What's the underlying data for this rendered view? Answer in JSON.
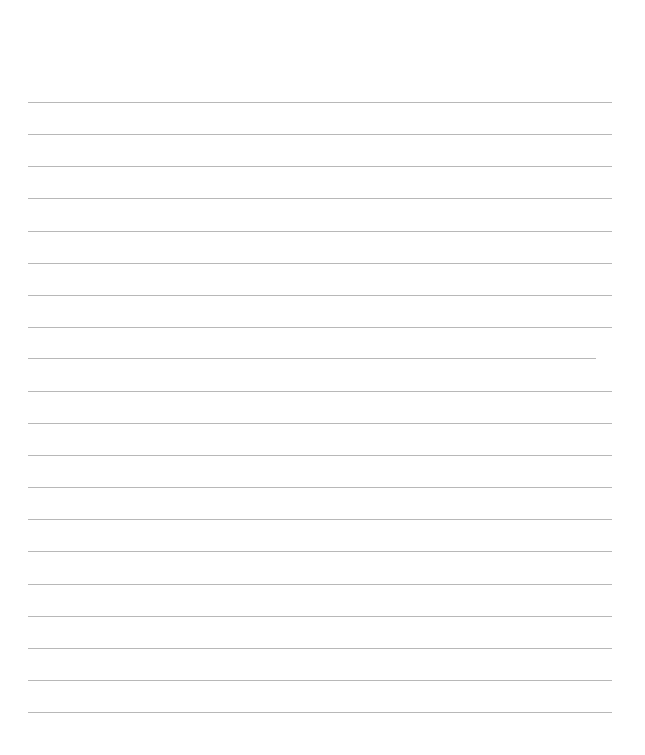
{
  "page": {
    "type": "lined-paper",
    "background_color": "#ffffff",
    "line_color": "#b8b8b8",
    "lines": [
      {
        "y": 102,
        "x1": 28,
        "x2": 612
      },
      {
        "y": 134,
        "x1": 28,
        "x2": 612
      },
      {
        "y": 166,
        "x1": 28,
        "x2": 612
      },
      {
        "y": 198,
        "x1": 28,
        "x2": 612
      },
      {
        "y": 231,
        "x1": 28,
        "x2": 612
      },
      {
        "y": 263,
        "x1": 28,
        "x2": 612
      },
      {
        "y": 295,
        "x1": 28,
        "x2": 612
      },
      {
        "y": 327,
        "x1": 28,
        "x2": 612
      },
      {
        "y": 358,
        "x1": 28,
        "x2": 596
      },
      {
        "y": 391,
        "x1": 28,
        "x2": 612
      },
      {
        "y": 423,
        "x1": 28,
        "x2": 612
      },
      {
        "y": 455,
        "x1": 28,
        "x2": 612
      },
      {
        "y": 487,
        "x1": 28,
        "x2": 612
      },
      {
        "y": 519,
        "x1": 28,
        "x2": 612
      },
      {
        "y": 551,
        "x1": 28,
        "x2": 612
      },
      {
        "y": 584,
        "x1": 28,
        "x2": 612
      },
      {
        "y": 616,
        "x1": 28,
        "x2": 612
      },
      {
        "y": 648,
        "x1": 28,
        "x2": 612
      },
      {
        "y": 680,
        "x1": 28,
        "x2": 612
      },
      {
        "y": 712,
        "x1": 28,
        "x2": 612
      }
    ]
  }
}
